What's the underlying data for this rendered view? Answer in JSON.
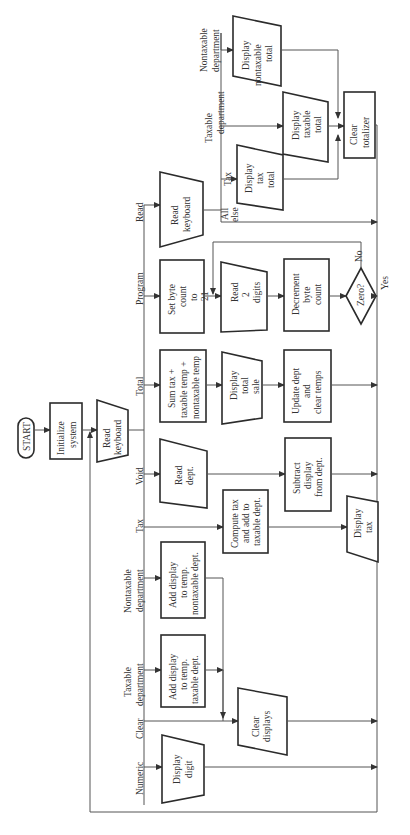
{
  "diagram": {
    "orientation": "rotated 90deg counter-clockwise (read bottom to top)",
    "start": {
      "label": "START"
    },
    "init": {
      "lines": [
        "Initialize",
        "system"
      ]
    },
    "read_keyboard_main": {
      "lines": [
        "Read",
        "keyboard"
      ]
    },
    "branches": [
      {
        "id": "numeric",
        "key_label": [
          "Numeric"
        ],
        "steps": [
          {
            "shape": "io",
            "lines": [
              "Display",
              "digit"
            ]
          }
        ]
      },
      {
        "id": "clear",
        "key_label": [
          "Clear"
        ],
        "steps": [
          {
            "shape": "io",
            "lines": [
              "Clear",
              "displays"
            ]
          }
        ]
      },
      {
        "id": "taxable",
        "key_label": [
          "Taxable",
          "department"
        ],
        "steps": [
          {
            "shape": "process",
            "lines": [
              "Add display",
              "to temp.",
              "taxable dept."
            ]
          }
        ]
      },
      {
        "id": "nontaxable",
        "key_label": [
          "Nontaxable",
          "department"
        ],
        "steps": [
          {
            "shape": "process",
            "lines": [
              "Add display",
              "to temp.",
              "nontaxable dept."
            ]
          }
        ]
      },
      {
        "id": "tax",
        "key_label": [
          "Tax"
        ],
        "steps": [
          {
            "shape": "process",
            "lines": [
              "Compute tax",
              "and add to",
              "taxable dept."
            ]
          },
          {
            "shape": "io",
            "lines": [
              "Display",
              "tax"
            ]
          }
        ]
      },
      {
        "id": "void",
        "key_label": [
          "Void"
        ],
        "steps": [
          {
            "shape": "io",
            "lines": [
              "Read",
              "dept."
            ]
          },
          {
            "shape": "process",
            "lines": [
              "Subtract",
              "display",
              "from dept."
            ]
          }
        ]
      },
      {
        "id": "total",
        "key_label": [
          "Total"
        ],
        "steps": [
          {
            "shape": "process",
            "lines": [
              "Sum tax +",
              "taxable temp +",
              "nontaxable temp"
            ]
          },
          {
            "shape": "io",
            "lines": [
              "Display",
              "total",
              "sale"
            ]
          },
          {
            "shape": "process",
            "lines": [
              "Update dept",
              "and",
              "clear temps"
            ]
          }
        ]
      },
      {
        "id": "program",
        "key_label": [
          "Program"
        ],
        "steps": [
          {
            "shape": "process",
            "lines": [
              "Set byte",
              "count",
              "to",
              "21"
            ]
          },
          {
            "shape": "io",
            "lines": [
              "Read",
              "2",
              "digits"
            ]
          },
          {
            "shape": "process",
            "lines": [
              "Decrement",
              "byte",
              "count"
            ]
          },
          {
            "shape": "decision",
            "lines": [
              "Zero?"
            ],
            "yes": "Yes",
            "no": "No"
          }
        ]
      },
      {
        "id": "read",
        "key_label": [
          "Read"
        ],
        "steps": [
          {
            "shape": "io",
            "lines": [
              "Read",
              "keyboard"
            ]
          }
        ]
      }
    ],
    "read_subbranches": [
      {
        "id": "tax_total",
        "key_label": [
          "Tax"
        ],
        "lines": [
          "Display",
          "tax",
          "total"
        ]
      },
      {
        "id": "taxable_total",
        "key_label": [
          "Taxable",
          "department"
        ],
        "lines": [
          "Display",
          "taxable",
          "total"
        ]
      },
      {
        "id": "nontaxable_total",
        "key_label": [
          "Nontaxable",
          "department"
        ],
        "lines": [
          "Display",
          "nontaxable",
          "total"
        ]
      },
      {
        "id": "all_else",
        "key_label": [
          "All",
          "else"
        ]
      }
    ],
    "clear_totalizer": {
      "lines": [
        "Clear",
        "totalizer"
      ]
    }
  }
}
